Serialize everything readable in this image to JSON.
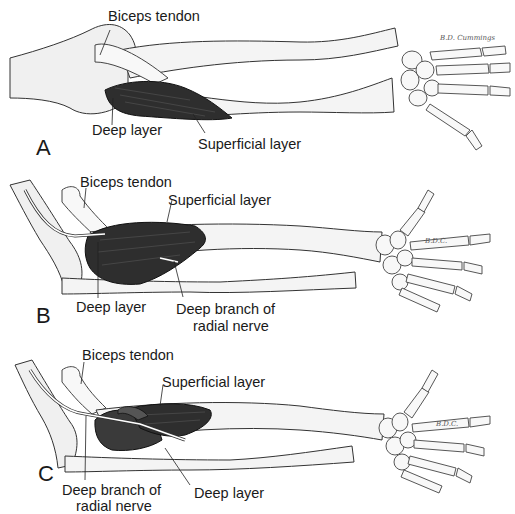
{
  "figure": {
    "stroke_color": "#222222",
    "muscle_color": "#2e2e2e",
    "bone_fill": "#f2f2f2",
    "panels": [
      {
        "letter": "A",
        "labels": {
          "biceps_tendon": "Biceps tendon",
          "deep_layer": "Deep layer",
          "superficial_layer": "Superficial layer"
        },
        "signature": "B.D. Cummings"
      },
      {
        "letter": "B",
        "labels": {
          "biceps_tendon": "Biceps tendon",
          "superficial_layer": "Superficial layer",
          "deep_layer": "Deep layer",
          "deep_branch_line1": "Deep branch of",
          "deep_branch_line2": "radial nerve"
        },
        "signature": "B.D.C."
      },
      {
        "letter": "C",
        "labels": {
          "biceps_tendon": "Biceps tendon",
          "superficial_layer": "Superficial layer",
          "deep_branch_line1": "Deep branch of",
          "deep_branch_line2": "radial nerve",
          "deep_layer": "Deep layer"
        },
        "signature": "B.D.C."
      }
    ]
  }
}
